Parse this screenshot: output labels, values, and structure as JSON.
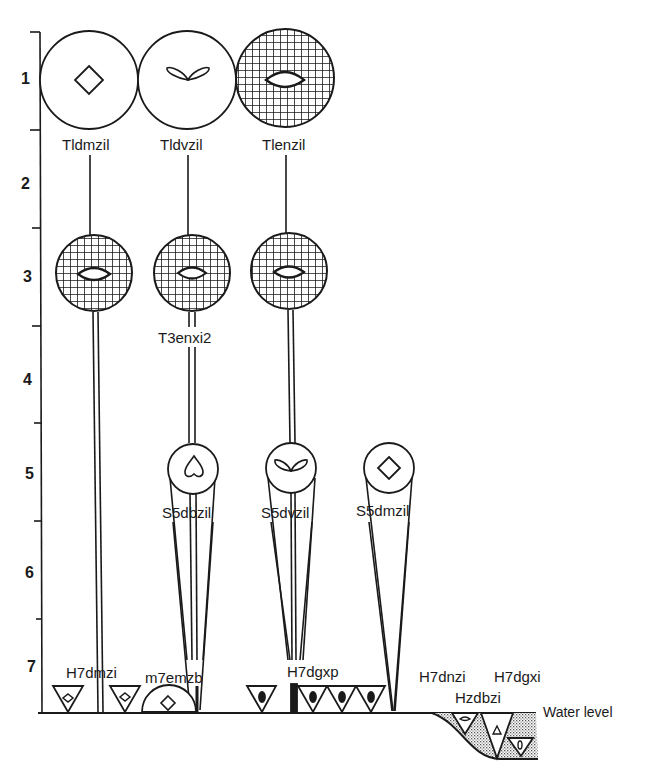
{
  "diagram": {
    "type": "life-form / stratification diagram",
    "axis": {
      "labels": [
        "1",
        "2",
        "3",
        "4",
        "5",
        "6",
        "7"
      ]
    },
    "nodes": {
      "row1": [
        {
          "label": "Tldmzil",
          "fill": "open",
          "glyph": "diamond"
        },
        {
          "label": "Tldvzil",
          "fill": "open",
          "glyph": "two-leaves"
        },
        {
          "label": "Tlenzil",
          "fill": "hatched",
          "glyph": "lens"
        }
      ],
      "row3": [
        {
          "label": "",
          "fill": "hatched",
          "glyph": "lens"
        },
        {
          "label": "T3enxi2",
          "fill": "hatched",
          "glyph": "lens"
        },
        {
          "label": "",
          "fill": "hatched",
          "glyph": "lens"
        }
      ],
      "row5": [
        {
          "label": "S5dbzil",
          "fill": "open",
          "glyph": "heart"
        },
        {
          "label": "S5dvzil",
          "fill": "open",
          "glyph": "two-leaves"
        },
        {
          "label": "S5dmzil",
          "fill": "open",
          "glyph": "diamond"
        }
      ],
      "ground": [
        {
          "label": "H7dmzi"
        },
        {
          "label": "m7emzb"
        },
        {
          "label": "H7dgxp"
        },
        {
          "label": "H7dnzi"
        },
        {
          "label": "Hzdbzi"
        },
        {
          "label": "H7dgxi"
        }
      ]
    },
    "water_level_label": "Water level",
    "colors": {
      "ink": "#1a1a1a",
      "paper": "#ffffff",
      "stipple": "#9a9a9a"
    }
  }
}
